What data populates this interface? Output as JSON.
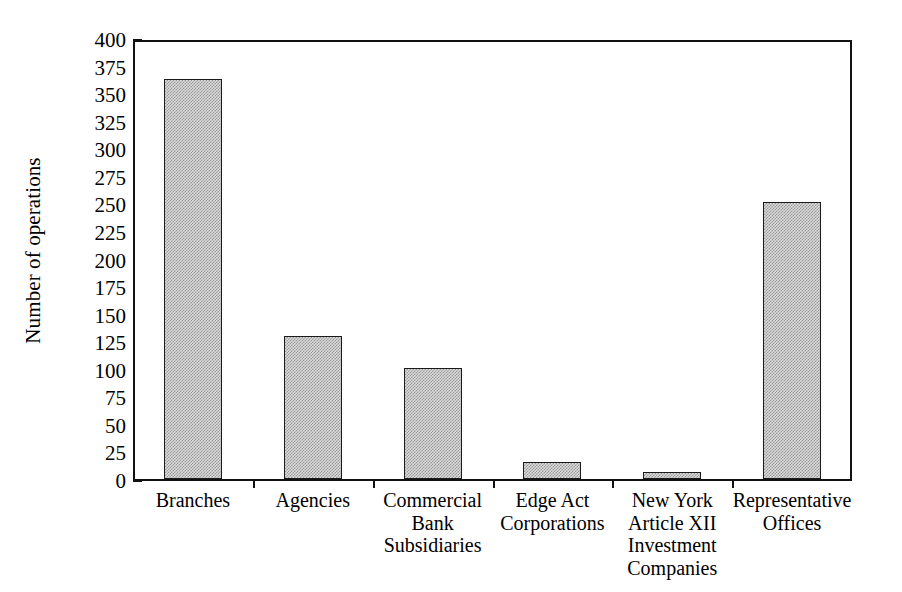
{
  "chart_data": {
    "type": "bar",
    "title": "",
    "xlabel": "",
    "ylabel": "Number of operations",
    "categories": [
      "Branches",
      "Agencies",
      "Commercial\nBank\nSubsidiaries",
      "Edge Act\nCorporations",
      "New York\nArticle XII\nInvestment\nCompanies",
      "Representative\nOffices"
    ],
    "values": [
      363,
      130,
      101,
      15,
      6,
      251
    ],
    "ylim": [
      0,
      400
    ],
    "ytick_step": 25,
    "yticks": [
      0,
      25,
      50,
      75,
      100,
      125,
      150,
      175,
      200,
      225,
      250,
      275,
      300,
      325,
      350,
      375,
      400
    ],
    "ytick_labels": [
      "0",
      "25",
      "50",
      "75",
      "100",
      "125",
      "150",
      "175",
      "200",
      "225",
      "250",
      "275",
      "300",
      "325",
      "350",
      "375",
      "400"
    ],
    "grid": false,
    "legend": false,
    "legend_position": "none",
    "bar_fill_color": "#d9d9d9",
    "bar_pattern": "fine-checkerboard-dither",
    "bar_edge_color": "#1a1a1a",
    "axis_color": "#111111",
    "background_color": "#ffffff"
  }
}
